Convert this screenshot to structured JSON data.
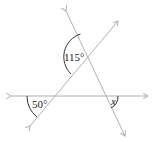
{
  "diagram": {
    "angles": [
      {
        "id": "top",
        "label": "115°"
      },
      {
        "id": "left",
        "label": "50°"
      },
      {
        "id": "right",
        "label": "x"
      }
    ],
    "colors": {
      "line": "#b0b0b0",
      "arc": "#333333",
      "text": "#222222"
    }
  }
}
